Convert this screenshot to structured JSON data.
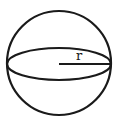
{
  "diagram": {
    "labels": {
      "radius": "r"
    },
    "colors": {
      "stroke": "#1a1a1a",
      "background": "#ffffff"
    }
  }
}
